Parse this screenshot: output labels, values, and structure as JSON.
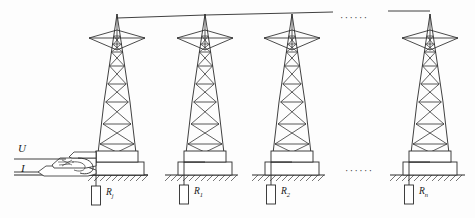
{
  "figure": {
    "background_color": "#fdfdfd",
    "line_color": "#2b2b2b"
  },
  "measurement": {
    "voltage_label": "U",
    "current_label": "I",
    "instrument_name": "clamp-meter"
  },
  "towers": [
    {
      "id": "tower-1",
      "x": 117,
      "resistor_label": "R",
      "resistor_subscript": "j"
    },
    {
      "id": "tower-2",
      "x": 205,
      "resistor_label": "R",
      "resistor_subscript": "1"
    },
    {
      "id": "tower-3",
      "x": 292,
      "resistor_label": "R",
      "resistor_subscript": "2"
    },
    {
      "id": "tower-4",
      "x": 430,
      "resistor_label": "R",
      "resistor_subscript": "n"
    }
  ],
  "resistor_labels": [
    {
      "text": "R",
      "sub": "j",
      "x": 99,
      "y": 190
    },
    {
      "text": "R",
      "sub": "1",
      "x": 193,
      "y": 189
    },
    {
      "text": "R",
      "sub": "2",
      "x": 280,
      "y": 189
    },
    {
      "text": "R",
      "sub": "n",
      "x": 418,
      "y": 189
    }
  ],
  "ellipses": [
    {
      "id": "ellipsis-top",
      "text": "······",
      "x": 345,
      "y": 12
    },
    {
      "id": "ellipsis-ground",
      "text": "······",
      "x": 350,
      "y": 168
    }
  ],
  "ground": {
    "line_y": 175,
    "hatch_label": "earth-hatching"
  },
  "labels": {
    "u": {
      "text": "U",
      "x": 20,
      "y": 150
    },
    "i": {
      "text": "I",
      "x": 22,
      "y": 169
    }
  }
}
